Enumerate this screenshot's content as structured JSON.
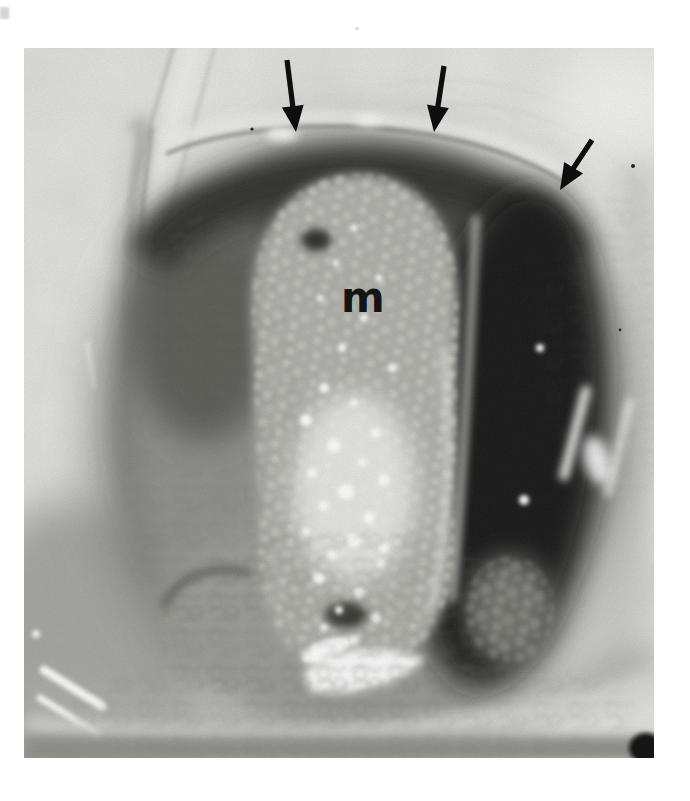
{
  "figure": {
    "type": "black-and-white clinical specimen photograph",
    "mass_label": "m",
    "label_color": "#141414",
    "arrow_color": "#0e0e0e",
    "paper_color": "#ffffff",
    "arrows": [
      {
        "name": "arrow-upper-left",
        "direction": "pointing down to lesion margin"
      },
      {
        "name": "arrow-upper-middle",
        "direction": "pointing down to lesion margin"
      },
      {
        "name": "arrow-upper-right",
        "direction": "pointing down-left to lesion margin"
      }
    ]
  }
}
